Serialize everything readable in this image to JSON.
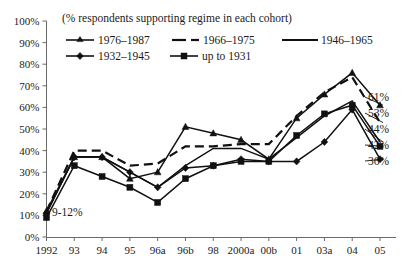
{
  "chart_data": {
    "type": "line",
    "title": "",
    "caption": "(% respondents supporting regime in each cohort)",
    "xlabel": "",
    "ylabel": "",
    "ylim": [
      0,
      100
    ],
    "ytick_labels": [
      "100%",
      "90%",
      "80%",
      "70%",
      "60%",
      "50%",
      "40%",
      "30%",
      "20%",
      "10%",
      "0%"
    ],
    "ytick_values": [
      100,
      90,
      80,
      70,
      60,
      50,
      40,
      30,
      20,
      10,
      0
    ],
    "grid": false,
    "legend_position": "top-inside",
    "categories": [
      "1992",
      "93",
      "94",
      "95",
      "96a",
      "96b",
      "98",
      "2000a",
      "00b",
      "01",
      "03a",
      "04",
      "05"
    ],
    "series": [
      {
        "name": "1976–1987",
        "marker": "triangle",
        "dash": "solid",
        "end_label": "61%",
        "values": [
          12,
          37,
          37,
          27,
          30,
          51,
          48,
          45,
          36,
          55,
          66,
          76,
          61
        ]
      },
      {
        "name": "1966–1975",
        "marker": "none",
        "dash": "dashed",
        "end_label": "53%",
        "values": [
          12,
          40,
          40,
          33,
          34,
          42,
          42,
          43,
          43,
          56,
          67,
          74,
          53
        ]
      },
      {
        "name": "1946–1965",
        "marker": "none",
        "dash": "solid",
        "end_label": "44%",
        "values": [
          11,
          37,
          37,
          30,
          23,
          33,
          41,
          41,
          36,
          46,
          56,
          63,
          44
        ]
      },
      {
        "name": "up to 1931",
        "marker": "square",
        "dash": "solid",
        "end_label": "42%",
        "values": [
          9,
          33,
          28,
          23,
          16,
          27,
          33,
          35,
          35,
          47,
          57,
          61,
          42
        ]
      },
      {
        "name": "1932–1945",
        "marker": "diamond",
        "dash": "solid",
        "end_label": "36%",
        "values": [
          11,
          37,
          37,
          30,
          23,
          32,
          33,
          36,
          35,
          35,
          44,
          59,
          36
        ]
      }
    ],
    "annotations": [
      {
        "text": "9-12%",
        "x_category": "1992",
        "value": 9
      }
    ]
  },
  "legend": {
    "entries": [
      {
        "label": "1976–1987"
      },
      {
        "label": "1966–1975"
      },
      {
        "label": "1946–1965"
      },
      {
        "label": "1932–1945"
      },
      {
        "label": "up to 1931"
      }
    ]
  },
  "colors": {
    "ink": "#111111",
    "axis": "#6a6a6a",
    "background": "#ffffff"
  }
}
